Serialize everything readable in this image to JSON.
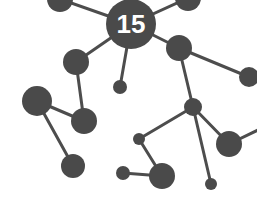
{
  "diagram": {
    "type": "network-graph",
    "background": "#ffffff",
    "node_color": "#4a4a4a",
    "edge_color": "#4d4d4d",
    "hub_label": "15",
    "hub_label_color": "#ffffff",
    "nodes": [
      {
        "id": "hub",
        "x": 131,
        "y": 24,
        "r": 25
      },
      {
        "id": "top-left",
        "x": 60,
        "y": -1,
        "r": 13
      },
      {
        "id": "top-right",
        "x": 188,
        "y": -2,
        "r": 13
      },
      {
        "id": "a",
        "x": 76,
        "y": 62,
        "r": 13
      },
      {
        "id": "small-center",
        "x": 120,
        "y": 87,
        "r": 7
      },
      {
        "id": "b",
        "x": 179,
        "y": 48,
        "r": 13
      },
      {
        "id": "far-right",
        "x": 249,
        "y": 77,
        "r": 10
      },
      {
        "id": "big-left",
        "x": 37,
        "y": 101,
        "r": 15
      },
      {
        "id": "c",
        "x": 84,
        "y": 121,
        "r": 13
      },
      {
        "id": "bottom-left",
        "x": 73,
        "y": 166,
        "r": 12
      },
      {
        "id": "d",
        "x": 193,
        "y": 107,
        "r": 9
      },
      {
        "id": "e",
        "x": 139,
        "y": 139,
        "r": 6
      },
      {
        "id": "f",
        "x": 229,
        "y": 144,
        "r": 13
      },
      {
        "id": "g",
        "x": 162,
        "y": 176,
        "r": 13
      },
      {
        "id": "h",
        "x": 123,
        "y": 173,
        "r": 7
      },
      {
        "id": "i",
        "x": 211,
        "y": 184,
        "r": 6
      }
    ],
    "edges": [
      {
        "from": "hub",
        "to": "top-left",
        "x1": 131,
        "y1": 24,
        "x2": 60,
        "y2": -1
      },
      {
        "from": "hub",
        "to": "top-right",
        "x1": 131,
        "y1": 24,
        "x2": 188,
        "y2": -2
      },
      {
        "from": "hub",
        "to": "a",
        "x1": 131,
        "y1": 24,
        "x2": 76,
        "y2": 62
      },
      {
        "from": "hub",
        "to": "small-center",
        "x1": 131,
        "y1": 24,
        "x2": 120,
        "y2": 87
      },
      {
        "from": "hub",
        "to": "b",
        "x1": 131,
        "y1": 24,
        "x2": 179,
        "y2": 48
      },
      {
        "from": "b",
        "to": "far-right",
        "x1": 179,
        "y1": 48,
        "x2": 249,
        "y2": 77
      },
      {
        "from": "b",
        "to": "d",
        "x1": 179,
        "y1": 48,
        "x2": 193,
        "y2": 107
      },
      {
        "from": "a",
        "to": "c",
        "x1": 76,
        "y1": 62,
        "x2": 84,
        "y2": 121
      },
      {
        "from": "big-left",
        "to": "c",
        "x1": 37,
        "y1": 101,
        "x2": 84,
        "y2": 121
      },
      {
        "from": "big-left",
        "to": "bottom-left",
        "x1": 37,
        "y1": 101,
        "x2": 73,
        "y2": 166
      },
      {
        "from": "d",
        "to": "e",
        "x1": 193,
        "y1": 107,
        "x2": 139,
        "y2": 139
      },
      {
        "from": "d",
        "to": "f",
        "x1": 193,
        "y1": 107,
        "x2": 229,
        "y2": 144
      },
      {
        "from": "d",
        "to": "i",
        "x1": 193,
        "y1": 107,
        "x2": 211,
        "y2": 184
      },
      {
        "from": "e",
        "to": "g",
        "x1": 139,
        "y1": 139,
        "x2": 162,
        "y2": 176
      },
      {
        "from": "h",
        "to": "g",
        "x1": 123,
        "y1": 173,
        "x2": 162,
        "y2": 176
      },
      {
        "from": "f",
        "to": "edge-right",
        "x1": 229,
        "y1": 144,
        "x2": 258,
        "y2": 130
      }
    ]
  }
}
